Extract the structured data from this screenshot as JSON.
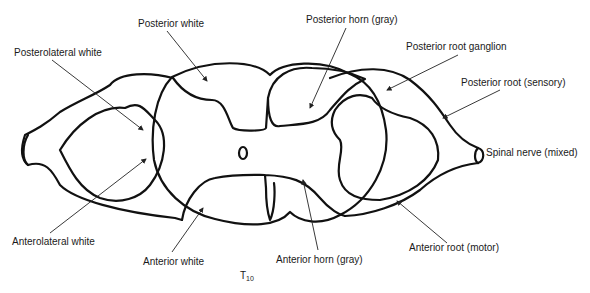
{
  "diagram": {
    "level_label": "T",
    "level_subscript": "10",
    "colors": {
      "outline": "#111111",
      "text": "#1a1a1a",
      "background": "#ffffff"
    },
    "labels": {
      "posterior_white": "Posterior white",
      "posterolateral_white": "Posterolateral white",
      "posterior_horn": "Posterior horn (gray)",
      "posterior_root_ganglion": "Posterior root ganglion",
      "posterior_root": "Posterior root (sensory)",
      "spinal_nerve": "Spinal nerve (mixed)",
      "anterolateral_white": "Anterolateral white",
      "anterior_white": "Anterior white",
      "anterior_horn": "Anterior horn (gray)",
      "anterior_root": "Anterior root (motor)"
    }
  }
}
